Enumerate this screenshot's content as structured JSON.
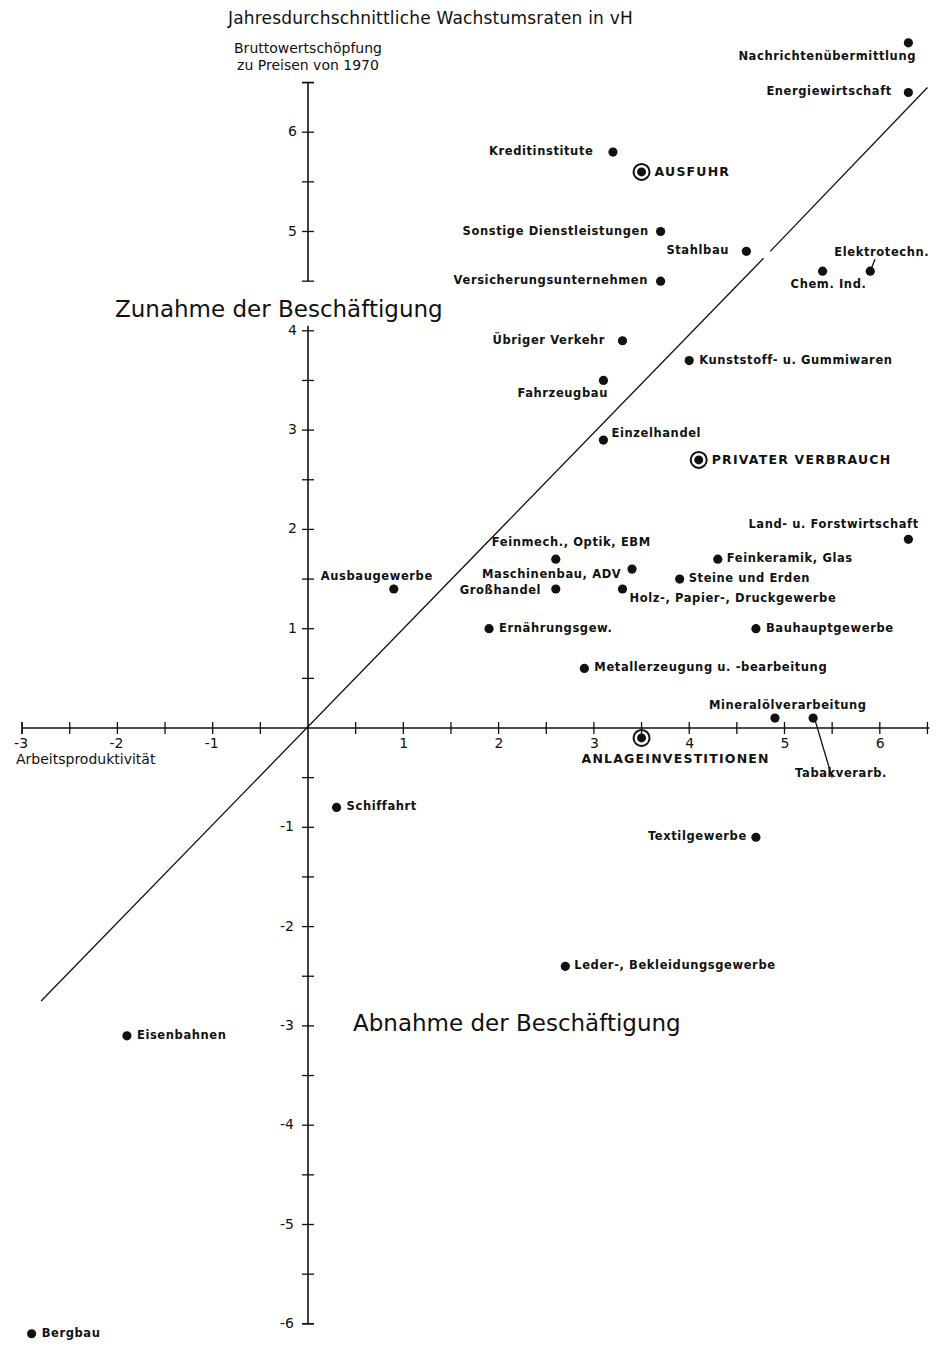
{
  "chart_data": {
    "type": "scatter",
    "title": "Jahresdurchschnittliche Wachstumsraten in vH",
    "xlabel": "Arbeitsproduktivität",
    "ylabel": "Bruttowertschöpfung zu Preisen von 1970",
    "xlim": [
      -3,
      6.5
    ],
    "ylim": [
      -6,
      6.5
    ],
    "xticks": [
      -3,
      -2,
      -1,
      1,
      2,
      3,
      4,
      5,
      6
    ],
    "yticks": [
      -6,
      -5,
      -4,
      -3,
      -2,
      -1,
      1,
      2,
      3,
      4,
      5,
      6
    ],
    "grid": false,
    "reference_line": {
      "description": "Diagonal through origin (y = x)",
      "from": [
        -2.8,
        -2.75
      ],
      "to": [
        6.5,
        6.45
      ]
    },
    "annotations": [
      {
        "text": "Zunahme der Beschäftigung",
        "region": "above diagonal"
      },
      {
        "text": "Abnahme der Beschäftigung",
        "region": "below diagonal"
      }
    ],
    "series": [
      {
        "name": "Wirtschaftszweige",
        "marker": "filled-dot",
        "points": [
          {
            "label": "Nachrichtenübermittlung",
            "x": 6.3,
            "y": 6.9
          },
          {
            "label": "Energiewirtschaft",
            "x": 6.3,
            "y": 6.4
          },
          {
            "label": "Kreditinstitute",
            "x": 3.2,
            "y": 5.8
          },
          {
            "label": "Sonstige Dienstleistungen",
            "x": 3.7,
            "y": 5.0
          },
          {
            "label": "Stahlbau",
            "x": 4.6,
            "y": 4.8
          },
          {
            "label": "Versicherungsunternehmen",
            "x": 3.7,
            "y": 4.5
          },
          {
            "label": "Chem. Ind.",
            "x": 5.4,
            "y": 4.6
          },
          {
            "label": "Elektrotechn.",
            "x": 5.9,
            "y": 4.6
          },
          {
            "label": "Übriger Verkehr",
            "x": 3.3,
            "y": 3.9
          },
          {
            "label": "Kunststoff- u. Gummiwaren",
            "x": 4.0,
            "y": 3.7
          },
          {
            "label": "Fahrzeugbau",
            "x": 3.1,
            "y": 3.5
          },
          {
            "label": "Einzelhandel",
            "x": 3.1,
            "y": 2.9
          },
          {
            "label": "Land- u. Forstwirtschaft",
            "x": 6.3,
            "y": 1.9
          },
          {
            "label": "Feinmech., Optik, EBM",
            "x": 2.6,
            "y": 1.7
          },
          {
            "label": "Feinkeramik, Glas",
            "x": 4.3,
            "y": 1.7
          },
          {
            "label": "Maschinenbau, ADV",
            "x": 3.4,
            "y": 1.6
          },
          {
            "label": "Steine und Erden",
            "x": 3.9,
            "y": 1.5
          },
          {
            "label": "Ausbaugewerbe",
            "x": 0.9,
            "y": 1.4
          },
          {
            "label": "Großhandel",
            "x": 2.6,
            "y": 1.4
          },
          {
            "label": "Holz-, Papier-, Druckgewerbe",
            "x": 3.3,
            "y": 1.4
          },
          {
            "label": "Ernährungsgew.",
            "x": 1.9,
            "y": 1.0
          },
          {
            "label": "Bauhauptgewerbe",
            "x": 4.7,
            "y": 1.0
          },
          {
            "label": "Metallerzeugung u. -bearbeitung",
            "x": 2.9,
            "y": 0.6
          },
          {
            "label": "Mineralölverarbeitung",
            "x": 4.9,
            "y": 0.1
          },
          {
            "label": "Tabakverarb.",
            "x": 5.3,
            "y": 0.1
          },
          {
            "label": "Schiffahrt",
            "x": 0.3,
            "y": -0.8
          },
          {
            "label": "Textilgewerbe",
            "x": 4.7,
            "y": -1.1
          },
          {
            "label": "Leder-, Bekleidungsgewerbe",
            "x": 2.7,
            "y": -2.4
          },
          {
            "label": "Eisenbahnen",
            "x": -1.9,
            "y": -3.1
          },
          {
            "label": "Bergbau",
            "x": -2.9,
            "y": -6.1
          }
        ]
      },
      {
        "name": "Gesamtwirtschaftliche Aggregate",
        "marker": "ringed-dot",
        "points": [
          {
            "label": "AUSFUHR",
            "x": 3.5,
            "y": 5.6
          },
          {
            "label": "PRIVATER VERBRAUCH",
            "x": 4.1,
            "y": 2.7
          },
          {
            "label": "ANLAGEINVESTITIONEN",
            "x": 3.5,
            "y": -0.1
          }
        ]
      }
    ]
  },
  "labels": {
    "title": "Jahresdurchschnittliche Wachstumsraten in vH",
    "ylabel_line1": "Bruttowertschöpfung",
    "ylabel_line2": "zu Preisen von 1970",
    "xlabel": "Arbeitsproduktivität",
    "region_up": "Zunahme der Beschäftigung",
    "region_down": "Abnahme der Beschäftigung"
  },
  "colors": {
    "ink": "#111111",
    "background": "#ffffff"
  }
}
